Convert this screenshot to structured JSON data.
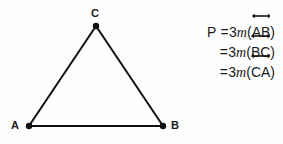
{
  "figure": {
    "background_color": "#fefefe",
    "ink_color": "#1a1a1a"
  },
  "triangle": {
    "name": "triangle-ABC",
    "stroke_color": "#111111",
    "stroke_width": 2,
    "vertex_dot_radius": 3.2,
    "vertices": [
      {
        "label": "A",
        "x": 29,
        "y": 126
      },
      {
        "label": "B",
        "x": 163,
        "y": 126
      },
      {
        "label": "C",
        "x": 96,
        "y": 26
      }
    ],
    "labels": {
      "a": "A",
      "b": "B",
      "c": "C"
    }
  },
  "equations": {
    "name": "perimeter-equations",
    "arrow_glyph": "double-headed-arrow",
    "lines": [
      {
        "lead": "P =",
        "coefficient": "3",
        "measure": "m",
        "open_paren": "(",
        "segment": "AB",
        "close_paren": ")",
        "overbar": "double-headed-arrow"
      },
      {
        "lead": "=",
        "coefficient": "3",
        "measure": "m",
        "open_paren": "(",
        "segment": "BC",
        "close_paren": ")",
        "overbar": "double-headed-arrow"
      },
      {
        "lead": "=",
        "coefficient": "3",
        "measure": "m",
        "open_paren": "(",
        "segment": "CA",
        "close_paren": ")",
        "overbar": "double-headed-arrow"
      }
    ]
  }
}
